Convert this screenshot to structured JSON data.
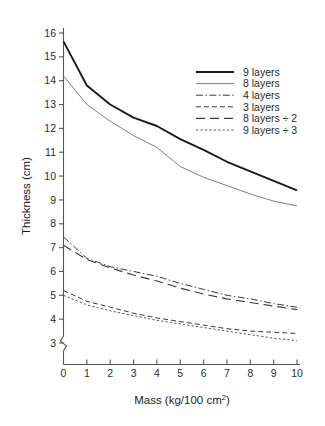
{
  "chart_data": {
    "type": "line",
    "title": "",
    "xlabel": "Mass (kg/100 cm2)",
    "xlabel_base": "Mass (kg/100 cm",
    "xlabel_sup": "2",
    "xlabel_tail": ")",
    "ylabel": "Thickness (cm)",
    "xlim": [
      0,
      10
    ],
    "ylim": [
      3,
      16
    ],
    "xticks": [
      "0",
      "1",
      "2",
      "3",
      "4",
      "5",
      "6",
      "7",
      "8",
      "9",
      "10"
    ],
    "yticks": [
      "3",
      "4",
      "5",
      "6",
      "7",
      "8",
      "9",
      "10",
      "11",
      "12",
      "13",
      "14",
      "15",
      "16"
    ],
    "grid": false,
    "y_axis_break": true,
    "legend_position": "upper right",
    "x": [
      0,
      1,
      2,
      3,
      4,
      5,
      6,
      7,
      8,
      9,
      10
    ],
    "series": [
      {
        "name": "9 layers",
        "style": "solid-thick",
        "color": "#1a1a1a",
        "values": [
          15.65,
          13.8,
          13.0,
          12.45,
          12.1,
          11.55,
          11.1,
          10.6,
          10.2,
          9.8,
          9.4
        ]
      },
      {
        "name": "8 layers",
        "style": "solid-thin",
        "color": "#707070",
        "values": [
          14.2,
          13.0,
          12.3,
          11.7,
          11.2,
          10.4,
          9.95,
          9.6,
          9.25,
          8.95,
          8.75
        ]
      },
      {
        "name": "4 layers",
        "style": "dash-dot",
        "color": "#3a3a3a",
        "values": [
          7.45,
          6.55,
          6.2,
          6.0,
          5.8,
          5.5,
          5.25,
          5.0,
          4.85,
          4.65,
          4.5
        ]
      },
      {
        "name": "3 layers",
        "style": "dashed",
        "color": "#3a3a3a",
        "values": [
          5.2,
          4.75,
          4.5,
          4.25,
          4.05,
          3.9,
          3.75,
          3.6,
          3.5,
          3.45,
          3.4
        ]
      },
      {
        "name": "8 layers ÷ 2",
        "style": "long-dash",
        "color": "#3a3a3a",
        "values": [
          7.1,
          6.5,
          6.15,
          5.85,
          5.6,
          5.3,
          5.05,
          4.85,
          4.7,
          4.55,
          4.4
        ]
      },
      {
        "name": "9 layers ÷ 3",
        "style": "dotted",
        "color": "#555555",
        "values": [
          5.0,
          4.6,
          4.35,
          4.15,
          3.95,
          3.8,
          3.65,
          3.5,
          3.35,
          3.2,
          3.1
        ]
      }
    ],
    "legend": [
      {
        "label": "9 layers",
        "style": "solid-thick"
      },
      {
        "label": "8 layers",
        "style": "solid-thin"
      },
      {
        "label": "4 layers",
        "style": "dash-dot"
      },
      {
        "label": "3 layers",
        "style": "dashed"
      },
      {
        "label": "8 layers ÷ 2",
        "style": "long-dash"
      },
      {
        "label": "9 layers ÷ 3",
        "style": "dotted"
      }
    ]
  }
}
